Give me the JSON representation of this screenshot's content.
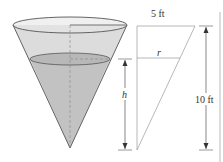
{
  "diagram": {
    "type": "conical tank with similar-triangle cross-section",
    "labels": {
      "top_radius": "5 ft",
      "height_total": "10 ft",
      "water_radius": "r",
      "water_height": "h"
    },
    "colors": {
      "cone_fill": "#d9d9d9",
      "water_fill": "#bdbdbd",
      "line": "#555555",
      "guide": "#888888"
    }
  }
}
